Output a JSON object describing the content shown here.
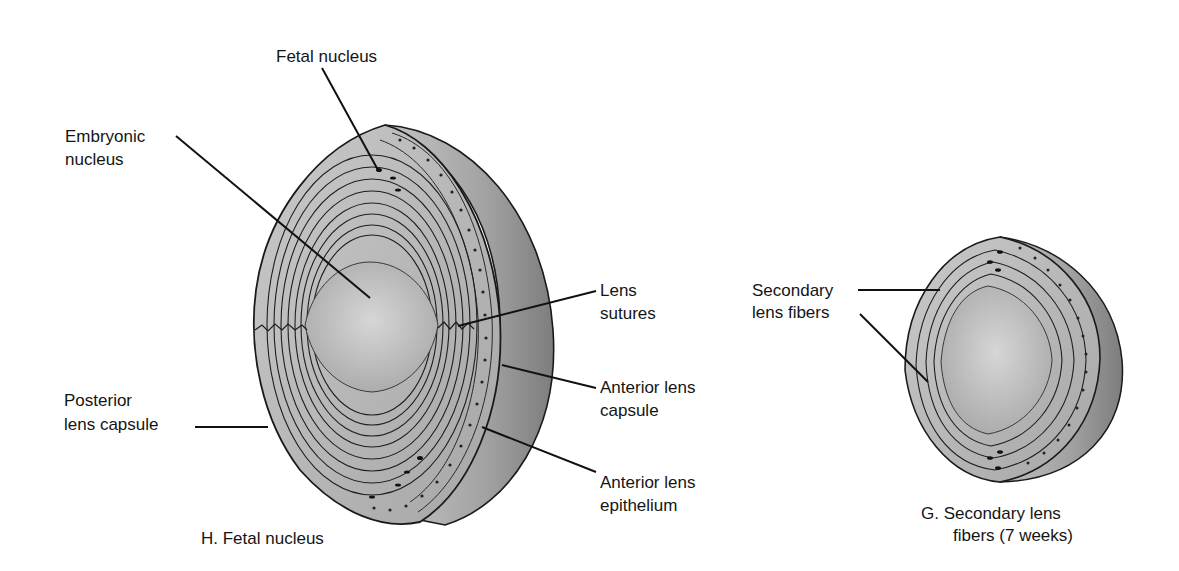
{
  "figure": {
    "panel_h": {
      "caption": "H.  Fetal nucleus",
      "labels": {
        "fetal_nucleus": "Fetal nucleus",
        "embryonic_nucleus_1": "Embryonic",
        "embryonic_nucleus_2": "nucleus",
        "lens_sutures_1": "Lens",
        "lens_sutures_2": "sutures",
        "posterior_capsule_1": "Posterior",
        "posterior_capsule_2": "lens capsule",
        "anterior_capsule_1": "Anterior lens",
        "anterior_capsule_2": "capsule",
        "anterior_epithelium_1": "Anterior lens",
        "anterior_epithelium_2": "epithelium"
      }
    },
    "panel_g": {
      "caption_1": "G.  Secondary lens",
      "caption_2": "fibers (7 weeks)",
      "labels": {
        "secondary_fibers_1": "Secondary",
        "secondary_fibers_2": "lens fibers"
      }
    },
    "colors": {
      "lens_fill": "#b4b4b4",
      "nucleus_fill": "#c8c8c8",
      "outline": "#1a1a1a",
      "shadow_side": "#8e8e8e"
    }
  }
}
